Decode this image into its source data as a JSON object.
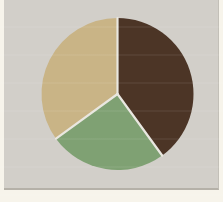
{
  "palette": {
    "page-bg": "#f7f4eb",
    "card-bg": "#d2cfc9",
    "card-edge-shadow": "#b5b1a8",
    "card-right-edge": "#c3c0b8"
  },
  "chart_data": {
    "type": "pie",
    "title": "",
    "legend": "none",
    "data_labels": "none",
    "start_angle_deg": 0,
    "direction": "clockwise",
    "geometry": {
      "cx": 117.5,
      "cy": 94,
      "r": 76
    },
    "separator": {
      "color": "#e9e7e0",
      "width": 2.2
    },
    "slices": [
      {
        "name": "dark-brown",
        "percent": 40,
        "color": "#4c3526"
      },
      {
        "name": "green",
        "percent": 25,
        "color": "#7fa173"
      },
      {
        "name": "tan",
        "percent": 35,
        "color": "#c9b486"
      }
    ]
  }
}
